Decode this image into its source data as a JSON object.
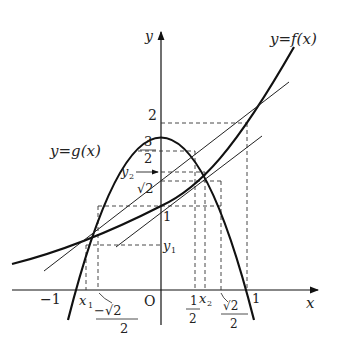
{
  "diagram": {
    "title_f": "y=f(x)",
    "title_g": "y=g(x)",
    "axis_x": "x",
    "axis_y": "y",
    "origin": "O",
    "y_labels": {
      "two": "2",
      "three": "3",
      "half_den": "2",
      "y2": "y",
      "y2_sub": "2",
      "sqrt2": "√2",
      "one": "1",
      "y1": "y",
      "y1_sub": "1"
    },
    "x_labels": {
      "neg_one": "−1",
      "x1": "x",
      "x1_sub": "1",
      "neg_sqrt2_num": "−√2",
      "neg_sqrt2_den": "2",
      "half_num": "1",
      "half_den": "2",
      "x2": "x",
      "x2_sub": "2",
      "sqrt2_num": "√2",
      "sqrt2_den": "2",
      "one": "1"
    },
    "functions": {
      "f": "2^x",
      "g": "2 - 2x^2"
    },
    "colors": {
      "stroke": "#111111",
      "dash": "#333333"
    }
  }
}
